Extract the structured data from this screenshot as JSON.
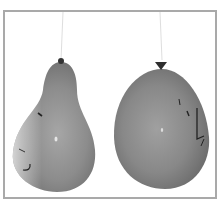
{
  "image": {
    "description": "Black and white photo of two hanging balloons with drawn faces",
    "frame_color": "#a9a9a9",
    "background": "#ffffff",
    "balloons": [
      {
        "name": "left-balloon",
        "shape": "pear",
        "face": "smiling face drawn on left side",
        "fill": "#8a8a8a"
      },
      {
        "name": "right-balloon",
        "shape": "round",
        "face": "face drawn on right side",
        "fill": "#858585"
      }
    ]
  }
}
